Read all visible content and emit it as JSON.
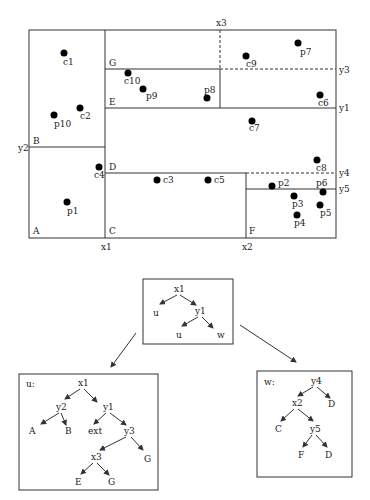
{
  "plane": {
    "axis_labels": {
      "x1": "x1",
      "x2": "x2",
      "x3": "x3",
      "y1": "y1",
      "y2": "y2",
      "y3": "y3",
      "y4": "y4",
      "y5": "y5"
    },
    "region_labels": {
      "A": "A",
      "B": "B",
      "C": "C",
      "D": "D",
      "E": "E",
      "F": "F",
      "G": "G"
    },
    "points": [
      {
        "id": "c1",
        "label": "c1"
      },
      {
        "id": "c2",
        "label": "c2"
      },
      {
        "id": "p10",
        "label": "p10"
      },
      {
        "id": "c10",
        "label": "c10"
      },
      {
        "id": "p9",
        "label": "p9"
      },
      {
        "id": "p8",
        "label": "p8"
      },
      {
        "id": "c9",
        "label": "c9"
      },
      {
        "id": "p7",
        "label": "p7"
      },
      {
        "id": "c6",
        "label": "c6"
      },
      {
        "id": "c7",
        "label": "c7"
      },
      {
        "id": "c4",
        "label": "c4"
      },
      {
        "id": "p1",
        "label": "p1"
      },
      {
        "id": "c3",
        "label": "c3"
      },
      {
        "id": "c5",
        "label": "c5"
      },
      {
        "id": "c8",
        "label": "c8"
      },
      {
        "id": "p2",
        "label": "p2"
      },
      {
        "id": "p6",
        "label": "p6"
      },
      {
        "id": "p3",
        "label": "p3"
      },
      {
        "id": "p5",
        "label": "p5"
      },
      {
        "id": "p4",
        "label": "p4"
      }
    ]
  },
  "trees": {
    "root": {
      "nodes": {
        "x1": "x1",
        "u_left": "u",
        "y1": "y1",
        "u_right": "u",
        "w": "w"
      }
    },
    "u": {
      "title": "u:",
      "nodes": {
        "x1": "x1",
        "y2": "y2",
        "y1": "y1",
        "A": "A",
        "B": "B",
        "ext": "ext",
        "y3": "y3",
        "x3": "x3",
        "G_right": "G",
        "E": "E",
        "G_bottom": "G"
      }
    },
    "w": {
      "title": "w:",
      "nodes": {
        "y4": "y4",
        "x2": "x2",
        "D_top": "D",
        "C": "C",
        "y5": "y5",
        "F": "F",
        "D_bottom": "D"
      }
    }
  }
}
